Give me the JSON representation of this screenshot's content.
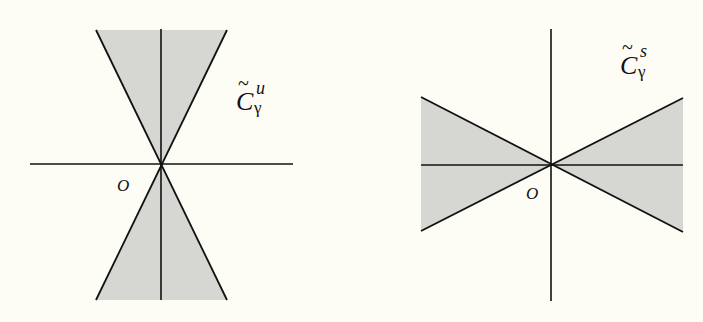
{
  "figure": {
    "background": "#fdfdf6",
    "fill_color": "#d6d6d2",
    "line_color": "#111111",
    "panels": [
      {
        "name": "unstable-cone",
        "label_main": "C",
        "label_tilde": "~",
        "label_sup": "u",
        "label_sub": "γ",
        "origin_label": "O",
        "orientation": "vertical"
      },
      {
        "name": "stable-cone",
        "label_main": "C",
        "label_tilde": "~",
        "label_sup": "s",
        "label_sub": "γ",
        "origin_label": "O",
        "orientation": "horizontal"
      }
    ]
  }
}
